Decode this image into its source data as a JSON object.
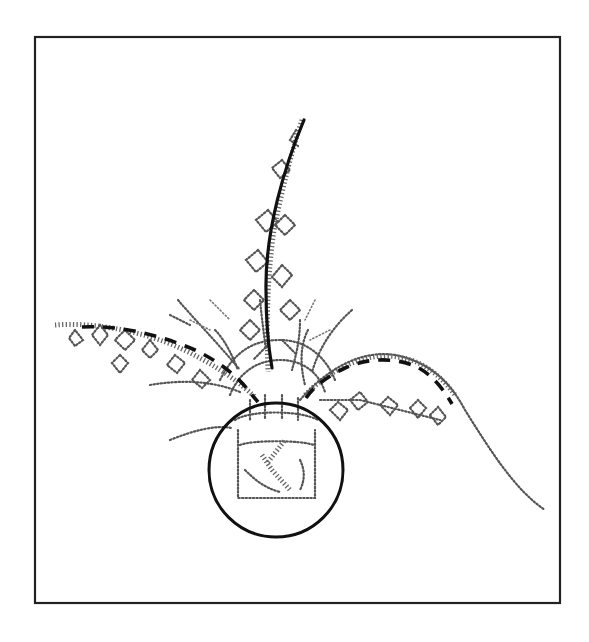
{
  "figure": {
    "colors": {
      "background": "#ffffff",
      "frame": "#222222",
      "guide_lines": "#111111",
      "stipple": "#555555"
    },
    "elements": {
      "frame": "rectangular border",
      "solid_line": "main upright stem line",
      "dashed_left": "left secondary branch line",
      "dashed_right": "right secondary branch line",
      "circle": "focal circle around vase",
      "vase": "stippled square vase"
    }
  }
}
